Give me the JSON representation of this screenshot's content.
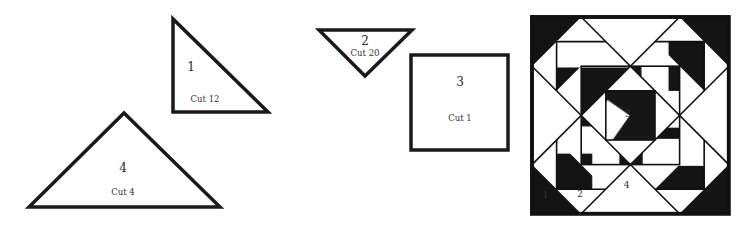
{
  "figure": {
    "type": "quilt-pattern-template",
    "colors": {
      "outline": "#1a1a1a",
      "fill": "#ffffff",
      "dark_fabric": "#111111"
    }
  },
  "pieces": [
    {
      "id": "piece-1",
      "number": "1",
      "cut": "Cut 12",
      "shape": "right-triangle"
    },
    {
      "id": "piece-2",
      "number": "2",
      "cut": "Cut 20",
      "shape": "triangle-inverted"
    },
    {
      "id": "piece-3",
      "number": "3",
      "cut": "Cut 1",
      "shape": "square"
    },
    {
      "id": "piece-4",
      "number": "4",
      "cut": "Cut 4",
      "shape": "large-triangle"
    }
  ],
  "block_diagram": {
    "labels": {
      "piece1": "1",
      "piece2": "2",
      "piece3": "3",
      "piece4": "4"
    }
  }
}
